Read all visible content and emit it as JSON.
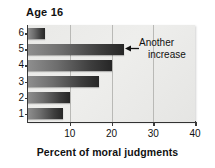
{
  "chart_data": {
    "type": "bar",
    "orientation": "horizontal",
    "title": "Age 16",
    "xlabel": "Percent of moral judgments",
    "ylabel": "",
    "categories": [
      "6",
      "5",
      "4",
      "3",
      "2",
      "1"
    ],
    "values": [
      4,
      23,
      20,
      17,
      10,
      8.5
    ],
    "xlim": [
      0,
      40
    ],
    "xticks": [
      10,
      20,
      30,
      40
    ],
    "yticks": [
      "6",
      "5",
      "4",
      "3",
      "2",
      "1"
    ],
    "grid": "vertical",
    "legend": "none",
    "annotations": [
      {
        "text_line1": "Another",
        "text_line2": "increase",
        "target_category": "5",
        "marker": "left-arrow"
      }
    ],
    "colors": {
      "bar_light": "#8e8e8e",
      "bar_dark": "#262626",
      "plot_background": "#eeeeec",
      "gridline": "#b9b9b6",
      "axis": "#3a3a3a",
      "text": "#111111",
      "figure_background": "#ffffff"
    }
  }
}
